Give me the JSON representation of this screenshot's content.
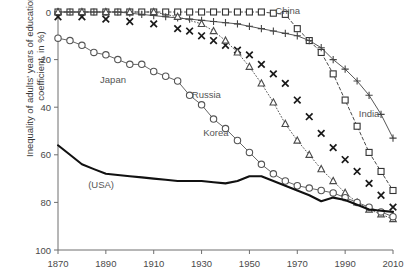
{
  "chart_data": {
    "type": "line",
    "title": "",
    "xlabel": "",
    "ylabel": "Inequality of adults' years of education (gini coefficient, in %)",
    "xlim": [
      1870,
      2010
    ],
    "ylim": [
      0,
      100
    ],
    "xticks": [
      1870,
      1890,
      1910,
      1930,
      1950,
      1970,
      1990,
      2010
    ],
    "yticks": [
      0,
      20,
      40,
      60,
      80,
      100
    ],
    "grid": false,
    "legend": "inline-annotations",
    "annotations": [
      {
        "text": "China",
        "x": 1966,
        "y": 99
      },
      {
        "text": "India",
        "x": 2000,
        "y": 56
      },
      {
        "text": "Japan",
        "x": 1893,
        "y": 70
      },
      {
        "text": "Russia",
        "x": 1932,
        "y": 64
      },
      {
        "text": "Korea",
        "x": 1936,
        "y": 48
      },
      {
        "text": "(USA)",
        "x": 1888,
        "y": 26
      }
    ],
    "series": [
      {
        "name": "China",
        "marker": "square",
        "line": "dashed",
        "color": "#333333",
        "x": [
          1870,
          1875,
          1880,
          1885,
          1890,
          1895,
          1900,
          1905,
          1910,
          1915,
          1920,
          1925,
          1930,
          1935,
          1940,
          1945,
          1950,
          1955,
          1960,
          1965,
          1970,
          1975,
          1980,
          1985,
          1990,
          1995,
          2000,
          2005,
          2010
        ],
        "values": [
          100,
          100,
          100,
          100,
          100,
          100,
          100,
          100,
          100,
          100,
          100,
          100,
          100,
          100,
          100,
          100,
          100,
          100,
          99.5,
          99,
          93,
          88,
          83,
          74,
          63,
          52,
          41,
          33,
          25
        ]
      },
      {
        "name": "India",
        "marker": "plus",
        "line": "solid",
        "color": "#444444",
        "x": [
          1870,
          1875,
          1880,
          1885,
          1890,
          1895,
          1900,
          1905,
          1910,
          1915,
          1920,
          1925,
          1930,
          1935,
          1940,
          1945,
          1950,
          1955,
          1960,
          1965,
          1970,
          1975,
          1980,
          1985,
          1990,
          1995,
          2000,
          2005,
          2010
        ],
        "values": [
          100,
          100,
          100,
          100,
          100,
          100,
          99.5,
          99,
          98.5,
          98,
          97.5,
          97,
          96.5,
          96,
          95.5,
          95,
          94,
          93,
          92,
          91,
          90,
          88,
          85,
          80,
          76,
          71,
          65,
          57,
          47
        ]
      },
      {
        "name": "Russia",
        "marker": "cross",
        "line": "none",
        "color": "#1a1a1a",
        "x": [
          1870,
          1880,
          1890,
          1900,
          1910,
          1920,
          1925,
          1930,
          1935,
          1940,
          1945,
          1950,
          1955,
          1960,
          1965,
          1970,
          1975,
          1980,
          1985,
          1990,
          1995,
          2000,
          2005,
          2010
        ],
        "values": [
          98,
          98,
          97,
          96,
          95,
          93,
          92,
          90,
          88,
          86,
          84,
          82,
          78,
          74,
          70,
          63,
          56,
          49,
          43,
          38,
          33,
          28,
          23,
          18
        ]
      },
      {
        "name": "Korea",
        "marker": "triangle",
        "line": "dotted",
        "color": "#4a4a4a",
        "x": [
          1870,
          1880,
          1890,
          1900,
          1910,
          1920,
          1930,
          1935,
          1940,
          1945,
          1950,
          1955,
          1960,
          1965,
          1970,
          1975,
          1980,
          1985,
          1990,
          1995,
          2000,
          2005,
          2010
        ],
        "values": [
          100,
          100,
          100,
          100,
          100,
          98,
          95,
          92,
          88,
          83,
          77,
          70,
          62,
          53,
          46,
          40,
          34,
          29,
          24,
          20,
          17,
          15,
          13
        ]
      },
      {
        "name": "Japan",
        "marker": "circle",
        "line": "solid",
        "color": "#555555",
        "x": [
          1870,
          1875,
          1880,
          1885,
          1890,
          1895,
          1900,
          1905,
          1910,
          1915,
          1920,
          1925,
          1930,
          1935,
          1940,
          1945,
          1950,
          1955,
          1960,
          1965,
          1970,
          1975,
          1980,
          1985,
          1990,
          1995,
          2000,
          2005,
          2010
        ],
        "values": [
          89,
          88,
          86,
          83,
          82,
          80,
          78,
          78,
          75,
          73,
          71,
          65,
          61,
          55,
          51,
          46,
          41,
          36,
          32,
          29,
          27,
          26,
          25,
          24,
          22,
          20,
          18,
          16,
          14
        ]
      },
      {
        "name": "(USA)",
        "marker": "none",
        "line": "solid-thick",
        "color": "#111111",
        "x": [
          1870,
          1875,
          1880,
          1885,
          1890,
          1895,
          1900,
          1905,
          1910,
          1915,
          1920,
          1925,
          1930,
          1935,
          1940,
          1945,
          1950,
          1955,
          1960,
          1965,
          1970,
          1975,
          1980,
          1985,
          1990,
          1995,
          2000,
          2005,
          2010
        ],
        "values": [
          44,
          40,
          36,
          34,
          32,
          31.5,
          31,
          30.5,
          30,
          29.5,
          29,
          29,
          29,
          28.5,
          28,
          29,
          31,
          31,
          29,
          27,
          25,
          23,
          20.5,
          22,
          21,
          19,
          17,
          16.5,
          16
        ]
      }
    ]
  },
  "axis": {
    "y_ticklabels": [
      "100",
      "80",
      "60",
      "40",
      "20",
      "0"
    ],
    "x_ticklabels": [
      "1870",
      "1890",
      "1910",
      "1930",
      "1950",
      "1970",
      "1990",
      "2010"
    ],
    "ylabel_text": "Inequality of adults' years of education (gini coefficient, in %)"
  }
}
